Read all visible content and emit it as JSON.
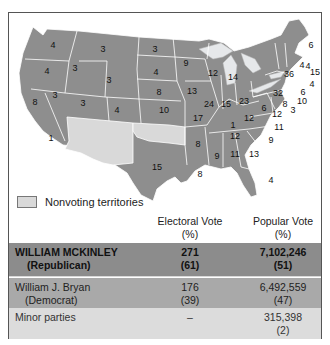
{
  "legend": {
    "nonvoting_label": "Nonvoting territories",
    "nonvoting_color": "#d9d9d9",
    "state_color": "#8e8e8e"
  },
  "map": {
    "states": [
      {
        "name": "Washington",
        "ev": "4"
      },
      {
        "name": "Oregon",
        "ev": "4"
      },
      {
        "name": "California",
        "ev": "8"
      },
      {
        "name": "California-south",
        "ev": "1"
      },
      {
        "name": "Idaho",
        "ev": "3"
      },
      {
        "name": "Nevada",
        "ev": "3"
      },
      {
        "name": "Montana",
        "ev": "3"
      },
      {
        "name": "Wyoming",
        "ev": "3"
      },
      {
        "name": "Utah",
        "ev": "3"
      },
      {
        "name": "Colorado",
        "ev": "4"
      },
      {
        "name": "North Dakota",
        "ev": "3"
      },
      {
        "name": "South Dakota",
        "ev": "4"
      },
      {
        "name": "Nebraska",
        "ev": "8"
      },
      {
        "name": "Kansas",
        "ev": "10"
      },
      {
        "name": "Texas",
        "ev": "15"
      },
      {
        "name": "Minnesota",
        "ev": "9"
      },
      {
        "name": "Iowa",
        "ev": "13"
      },
      {
        "name": "Missouri",
        "ev": "17"
      },
      {
        "name": "Arkansas",
        "ev": "8"
      },
      {
        "name": "Louisiana",
        "ev": "8"
      },
      {
        "name": "Wisconsin",
        "ev": "12"
      },
      {
        "name": "Illinois",
        "ev": "24"
      },
      {
        "name": "Michigan",
        "ev": "14"
      },
      {
        "name": "Indiana",
        "ev": "15"
      },
      {
        "name": "Ohio",
        "ev": "23"
      },
      {
        "name": "Kentucky-split",
        "ev": "1"
      },
      {
        "name": "Kentucky",
        "ev": "12"
      },
      {
        "name": "Tennessee",
        "ev": "12"
      },
      {
        "name": "Mississippi",
        "ev": "9"
      },
      {
        "name": "Alabama",
        "ev": "11"
      },
      {
        "name": "Georgia",
        "ev": "13"
      },
      {
        "name": "Florida",
        "ev": "4"
      },
      {
        "name": "South Carolina",
        "ev": "9"
      },
      {
        "name": "North Carolina",
        "ev": "11"
      },
      {
        "name": "Virginia",
        "ev": "12"
      },
      {
        "name": "West Virginia",
        "ev": "6"
      },
      {
        "name": "Pennsylvania",
        "ev": "32"
      },
      {
        "name": "Maryland",
        "ev": "8"
      },
      {
        "name": "Delaware",
        "ev": "3"
      },
      {
        "name": "New Jersey",
        "ev": "10"
      },
      {
        "name": "Connecticut",
        "ev": "6"
      },
      {
        "name": "Rhode Island",
        "ev": "4"
      },
      {
        "name": "Massachusetts",
        "ev": "15"
      },
      {
        "name": "New York",
        "ev": "36"
      },
      {
        "name": "Vermont",
        "ev": "4"
      },
      {
        "name": "New Hampshire",
        "ev": "4"
      },
      {
        "name": "Maine",
        "ev": "6"
      }
    ]
  },
  "table": {
    "headers": {
      "electoral": "Electoral Vote",
      "electoral_sub": "(%)",
      "popular": "Popular Vote",
      "popular_sub": "(%)"
    },
    "rows": [
      {
        "candidate": "WILLIAM MCKINLEY",
        "party": "(Republican)",
        "electoral": "271",
        "electoral_pct": "(61)",
        "popular": "7,102,246",
        "popular_pct": "(51)",
        "color": "#8c8c8c"
      },
      {
        "candidate": "William J. Bryan",
        "party": "(Democrat)",
        "electoral": "176",
        "electoral_pct": "(39)",
        "popular": "6,492,559",
        "popular_pct": "(47)",
        "color": "#a9a9a9"
      },
      {
        "candidate": "Minor parties",
        "party": "",
        "electoral": "–",
        "electoral_pct": "",
        "popular": "315,398",
        "popular_pct": "(2)",
        "color": "#dcdcdc"
      }
    ]
  }
}
